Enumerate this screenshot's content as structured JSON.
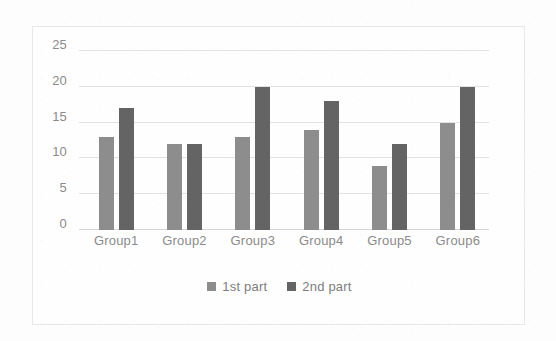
{
  "chart_data": {
    "type": "bar",
    "title": "",
    "subtitle": "",
    "xlabel": "",
    "ylabel": "",
    "categories": [
      "Group1",
      "Group2",
      "Group3",
      "Group4",
      "Group5",
      "Group6"
    ],
    "series": [
      {
        "name": "1st part",
        "values": [
          13,
          12,
          13,
          14,
          9,
          15
        ],
        "color": "#8d8d8d"
      },
      {
        "name": "2nd part",
        "values": [
          17,
          12,
          20,
          18,
          12,
          20
        ],
        "color": "#646464"
      }
    ],
    "ylim": [
      0,
      25
    ],
    "y_ticks": [
      0,
      5,
      10,
      15,
      20,
      25
    ],
    "y_tick_labels": [
      "0",
      "5",
      "10",
      "15",
      "20",
      "25"
    ],
    "grid": true,
    "grid_axis": "y",
    "legend_position": "bottom",
    "annotations": []
  },
  "chart": {
    "frame_border_color": "#e8e8e8",
    "gridline_color": "#e2e2e2",
    "tick_label_color": "#8b8b8b",
    "legend_label_color": "#7d7d7d",
    "background_color": "#fdfdfd"
  }
}
